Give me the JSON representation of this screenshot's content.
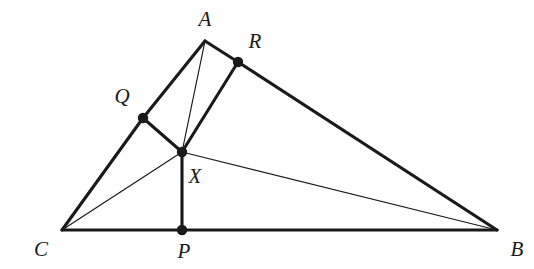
{
  "figure": {
    "type": "euclidean-geometry-diagram",
    "background_color": "#ffffff",
    "ink_color": "#1a1a1a",
    "width": 534,
    "height": 269
  },
  "points": [
    {
      "id": "A",
      "label": "A",
      "x": 205,
      "y": 41,
      "marked": false,
      "label_x": 205,
      "label_y": 19
    },
    {
      "id": "B",
      "label": "B",
      "x": 497,
      "y": 230,
      "marked": false,
      "label_x": 517,
      "label_y": 249
    },
    {
      "id": "C",
      "label": "C",
      "x": 62,
      "y": 230,
      "marked": false,
      "label_x": 41,
      "label_y": 249
    },
    {
      "id": "P",
      "label": "P",
      "x": 182,
      "y": 230,
      "marked": true,
      "label_x": 184,
      "label_y": 251
    },
    {
      "id": "Q",
      "label": "Q",
      "x": 143,
      "y": 118,
      "marked": true,
      "label_x": 122,
      "label_y": 96
    },
    {
      "id": "R",
      "label": "R",
      "x": 238,
      "y": 62,
      "marked": true,
      "label_x": 255,
      "label_y": 41
    },
    {
      "id": "X",
      "label": "X",
      "x": 182,
      "y": 152,
      "marked": true,
      "label_x": 195,
      "label_y": 176
    }
  ],
  "segments": [
    {
      "id": "C-B",
      "from": "C",
      "to": "B",
      "weight": "thick"
    },
    {
      "id": "C-Q",
      "from": "C",
      "to": "Q",
      "weight": "thick"
    },
    {
      "id": "Q-A",
      "from": "Q",
      "to": "A",
      "weight": "thick"
    },
    {
      "id": "A-R",
      "from": "A",
      "to": "R",
      "weight": "thick"
    },
    {
      "id": "R-B",
      "from": "R",
      "to": "B",
      "weight": "thick"
    },
    {
      "id": "Q-X",
      "from": "Q",
      "to": "X",
      "weight": "thick"
    },
    {
      "id": "R-X",
      "from": "R",
      "to": "X",
      "weight": "thick"
    },
    {
      "id": "X-P",
      "from": "X",
      "to": "P",
      "weight": "thick"
    },
    {
      "id": "A-X",
      "from": "A",
      "to": "X",
      "weight": "thin"
    },
    {
      "id": "C-X",
      "from": "C",
      "to": "X",
      "weight": "thin"
    },
    {
      "id": "X-B",
      "from": "X",
      "to": "B",
      "weight": "thin"
    }
  ],
  "style": {
    "thick_width": 3.1,
    "thin_width": 1.2,
    "dot_radius": 5.2
  }
}
